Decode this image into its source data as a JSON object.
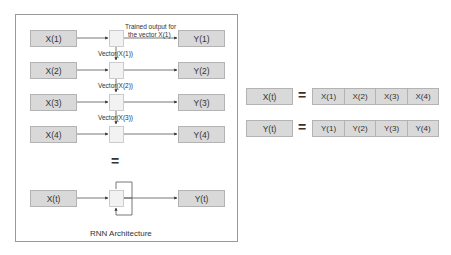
{
  "rnn_diagram": {
    "caption": "RNN Architecture",
    "inputs": [
      "X(1)",
      "X(2)",
      "X(3)",
      "X(4)"
    ],
    "outputs": [
      "Y(1)",
      "Y(2)",
      "Y(3)",
      "Y(4)"
    ],
    "hidden_labels": [
      "Vector(X(1))",
      "Vector(X(2))",
      "Vector(X(3))"
    ],
    "annotation_line1": "Trained output for",
    "annotation_line2": "the vector X(1)",
    "equals": "=",
    "rolled_input": "X(t)",
    "rolled_output": "Y(t)"
  },
  "sequence_defs": {
    "x_row": {
      "lhs": "X(t)",
      "eq": "=",
      "cells": [
        "X(1)",
        "X(2)",
        "X(3)",
        "X(4)"
      ]
    },
    "y_row": {
      "lhs": "Y(t)",
      "eq": "=",
      "cells": [
        "Y(1)",
        "Y(2)",
        "Y(3)",
        "Y(4)"
      ]
    }
  }
}
